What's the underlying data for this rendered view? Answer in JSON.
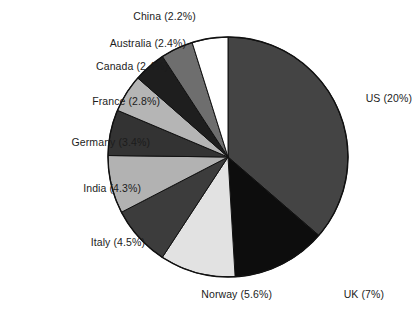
{
  "chart_data": {
    "type": "pie",
    "title": "",
    "subtitle": "",
    "xlabel": "",
    "ylabel": "",
    "legend_position": "none",
    "grid": false,
    "labels_show_percent": true,
    "categories": [
      "US",
      "UK",
      "Norway",
      "Italy",
      "India",
      "Germany",
      "France",
      "Canada",
      "Australia",
      "China"
    ],
    "values": [
      20,
      7,
      5.6,
      4.5,
      4.3,
      3.4,
      2.8,
      2.4,
      2.4,
      2.2
    ],
    "value_unit": "%",
    "start_angle_deg": 0,
    "direction": "clockwise",
    "slices": [
      {
        "label": "US",
        "value": 20,
        "text": "US (20%)",
        "color": "#444444",
        "angle_deg": 130.8,
        "label_pos": "right"
      },
      {
        "label": "UK",
        "value": 7,
        "text": "UK (7%)",
        "color": "#0d0d0d",
        "angle_deg": 45.8,
        "label_pos": "bottom"
      },
      {
        "label": "Norway",
        "value": 5.6,
        "text": "Norway (5.6%)",
        "color": "#e2e2e2",
        "angle_deg": 36.6,
        "label_pos": "bottom"
      },
      {
        "label": "Italy",
        "value": 4.5,
        "text": "Italy (4.5%)",
        "color": "#3c3c3c",
        "angle_deg": 29.4,
        "label_pos": "left"
      },
      {
        "label": "India",
        "value": 4.3,
        "text": "India (4.3%)",
        "color": "#b2b2b2",
        "angle_deg": 28.1,
        "label_pos": "left"
      },
      {
        "label": "Germany",
        "value": 3.4,
        "text": "Germany (3.4%)",
        "color": "#333333",
        "angle_deg": 22.2,
        "label_pos": "left"
      },
      {
        "label": "France",
        "value": 2.8,
        "text": "France (2.8%)",
        "color": "#b5b5b5",
        "angle_deg": 18.3,
        "label_pos": "left"
      },
      {
        "label": "Canada",
        "value": 2.4,
        "text": "Canada (2.4%)",
        "color": "#1e1e1e",
        "angle_deg": 15.7,
        "label_pos": "left"
      },
      {
        "label": "Australia",
        "value": 2.4,
        "text": "Australia (2.4%)",
        "color": "#6e6e6e",
        "angle_deg": 15.7,
        "label_pos": "left"
      },
      {
        "label": "China",
        "value": 2.2,
        "text": "China (2.2%)",
        "color": "#ffffff",
        "angle_deg": 17.4,
        "label_pos": "top"
      }
    ],
    "geometry": {
      "cx": 228,
      "cy": 157,
      "r": 120
    },
    "background": "#ffffff",
    "outline_color": "#111111"
  }
}
